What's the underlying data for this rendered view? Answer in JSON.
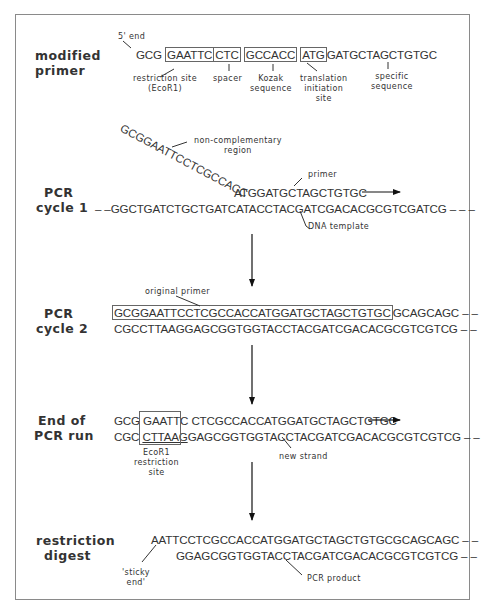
{
  "figure": {
    "stages": {
      "modified_primer": {
        "label_line1": "modified",
        "label_line2": "primer",
        "five_prime_label": "5' end",
        "segments": [
          "GCG",
          "GAATTC",
          "CTC",
          "GCCACC",
          "ATG",
          "GATGCTAGCTGTGC"
        ],
        "annotations": {
          "restriction_site_l1": "restriction site",
          "restriction_site_l2": "(EcoR1)",
          "spacer": "spacer",
          "kozak_l1": "Kozak",
          "kozak_l2": "sequence",
          "translation_l1": "translation",
          "translation_l2": "initiation",
          "translation_l3": "site",
          "specific_l1": "specific",
          "specific_l2": "sequence"
        }
      },
      "cycle1": {
        "label_line1": "PCR",
        "label_line2": "cycle 1",
        "diagonal_tail": "GCGGAATTCCTCGCCACC",
        "primer_seq": "ATGGATGCTAGCTGTGC",
        "template_prefix": "– –",
        "template_seq": "GGCTGATCTGCTGATCATACCTACGATCGACACGCGTCGATCG",
        "template_suffix": "– – –",
        "annotations": {
          "noncomp_l1": "non-complementary",
          "noncomp_l2": "region",
          "primer": "primer",
          "template": "DNA template"
        }
      },
      "cycle2": {
        "label_line1": "PCR",
        "label_line2": "cycle 2",
        "top_boxed": "GCGGAATTCCTCGCCACCATGGATGCTAGCTGTGC",
        "top_rest": "GCAGCAGC",
        "top_suffix": "– –",
        "bottom_seq": "CGCCTTAAGGAGCGGTGGTACCTACGATCGACACGCGTCGTCG",
        "bottom_suffix": "– –",
        "annotations": {
          "original_primer": "original primer"
        }
      },
      "end_of_run": {
        "label_line1": "End of",
        "label_line2": "PCR run",
        "top_pre": "GCG",
        "top_site": "GAATTC",
        "top_rest": "CTCGCCACCATGGATGCTAGCTGTGC",
        "bottom_pre": "CGC",
        "bottom_site": "CTTAAG",
        "bottom_rest": "GAGCGGTGGTACCTACGATCGACACGCGTCGTCG",
        "bottom_suffix": "– –",
        "annotations": {
          "ecor1_l1": "EcoR1",
          "ecor1_l2": "restriction",
          "ecor1_l3": "site",
          "new_strand": "new strand"
        }
      },
      "digest": {
        "label_line1": "restriction",
        "label_line2": "digest",
        "top_seq": "AATTCCTCGCCACCATGGATGCTAGCTGTGCGCAGCAGC",
        "top_suffix": "– –",
        "bottom_seq": "GGAGCGGTGGTACCTACGATCGACACGCGTCGTCG",
        "bottom_suffix": "– –",
        "annotations": {
          "sticky_l1": "'sticky",
          "sticky_l2": "end'",
          "product": "PCR product"
        }
      }
    },
    "colors": {
      "text": "#333333",
      "frame": "#8a8a8a",
      "box": "#666666",
      "arrow": "#111111"
    }
  }
}
